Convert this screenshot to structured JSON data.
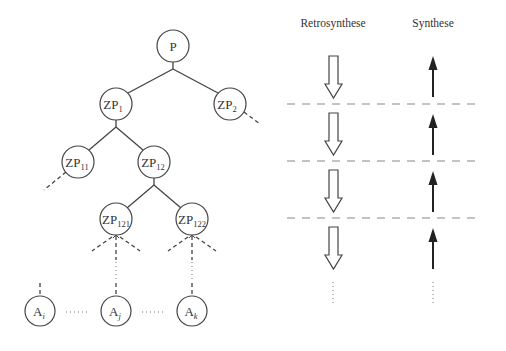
{
  "headers": {
    "retro": "Retrosynthese",
    "syn": "Synthese"
  },
  "nodes": {
    "P": {
      "main": "P",
      "sub": ""
    },
    "ZP1": {
      "main": "ZP",
      "sub": "1"
    },
    "ZP2": {
      "main": "ZP",
      "sub": "2"
    },
    "ZP11": {
      "main": "ZP",
      "sub": "11"
    },
    "ZP12": {
      "main": "ZP",
      "sub": "12"
    },
    "ZP121": {
      "main": "ZP",
      "sub": "121"
    },
    "ZP122": {
      "main": "ZP",
      "sub": "122"
    },
    "Ai": {
      "main": "A",
      "sub": "i"
    },
    "Aj": {
      "main": "A",
      "sub": "j"
    },
    "Ak": {
      "main": "A",
      "sub": "k"
    }
  },
  "colors": {
    "stroke": "#444444",
    "dash": "#888888",
    "background": "#ffffff"
  }
}
